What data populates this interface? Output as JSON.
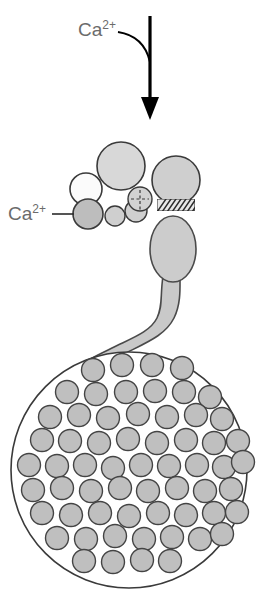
{
  "figure": {
    "width": 259,
    "height": 591,
    "background_color": "#ffffff"
  },
  "labels": {
    "influx": {
      "base": "Ca",
      "superscript": "2+",
      "full": "Ca2+",
      "color": "#6b6b6b",
      "x": 78,
      "y": 36
    },
    "binding": {
      "base": "Ca",
      "superscript": "2+",
      "full": "Ca2+",
      "color": "#6b6b6b",
      "x": 10,
      "y": 220
    }
  },
  "arrow": {
    "name": "calcium-influx-arrow",
    "color": "#000000",
    "shaft_x": 150,
    "shaft_top_y": 16,
    "shaft_bottom_y": 100,
    "shaft_width": 3,
    "head_tip_y": 120,
    "head_half_width": 9,
    "curve": {
      "start_x": 118,
      "start_y": 32,
      "end_x": 150,
      "end_y": 62,
      "color": "#000000",
      "stroke_width": 2
    }
  },
  "colors": {
    "outline_dark": "#3a3a3a",
    "outline_mid": "#555555",
    "fill_light": "#dcdcdc",
    "fill_white": "#fcfcfc",
    "fill_mid": "#c4c4c4",
    "fill_vesicle": "#bfbfbf",
    "fill_neck": "#c9c9c9",
    "hatch_color": "#2b2b2b",
    "label_gray": "#6b6b6b",
    "cell_interior": "#ffffff"
  },
  "cluster": {
    "name": "membrane-protein-cluster",
    "description": "Cluster of circles representing vesicle and membrane proteins near the release site",
    "circles": [
      {
        "name": "large-upper-granule",
        "cx": 121,
        "cy": 166,
        "r": 24,
        "fill": "#d8d8d8",
        "stroke": "#3a3a3a",
        "stroke_width": 1.6
      },
      {
        "name": "right-upper-granule",
        "cx": 176,
        "cy": 180,
        "r": 24,
        "fill": "#cfcfcf",
        "stroke": "#3a3a3a",
        "stroke_width": 1.6
      },
      {
        "name": "white-left-circle",
        "cx": 86,
        "cy": 189,
        "r": 16,
        "fill": "#fbfbfb",
        "stroke": "#3a3a3a",
        "stroke_width": 1.6
      },
      {
        "name": "ca-binding-circle",
        "cx": 88,
        "cy": 214,
        "r": 15,
        "fill": "#bdbdbd",
        "stroke": "#3a3a3a",
        "stroke_width": 1.6
      },
      {
        "name": "small-chain-circle-1",
        "cx": 115,
        "cy": 216,
        "r": 10,
        "fill": "#cfcfcf",
        "stroke": "#3a3a3a",
        "stroke_width": 1.4
      },
      {
        "name": "small-chain-circle-2",
        "cx": 136,
        "cy": 211,
        "r": 11,
        "fill": "#cfcfcf",
        "stroke": "#3a3a3a",
        "stroke_width": 1.4
      },
      {
        "name": "dashed-fusion-circle",
        "cx": 140,
        "cy": 199,
        "r": 12,
        "fill": "#d2d2d2",
        "stroke": "#3a3a3a",
        "stroke_width": 1.4
      }
    ],
    "dashed_marks": [
      {
        "name": "dashed-vertical-mark",
        "x1": 140,
        "y1": 190,
        "x2": 140,
        "y2": 211
      },
      {
        "name": "dashed-horizontal-mark",
        "x1": 131,
        "y1": 199,
        "x2": 149,
        "y2": 199
      }
    ],
    "hatched_zone": {
      "name": "membrane-fusion-hatched-zone",
      "x": 157,
      "y": 199,
      "width": 38,
      "height": 12,
      "stripe_count": 9,
      "color": "#2b2b2b"
    },
    "leader_line": {
      "name": "calcium-binding-leader-line",
      "x1": 52,
      "y1": 214,
      "x2": 74,
      "y2": 214,
      "color": "#2b2b2b",
      "stroke_width": 1.6
    }
  },
  "flask": {
    "name": "fusing-granule-flask",
    "description": "Teardrop shaped fusing granule narrowing into a winding neck",
    "fill": "#cccccc",
    "stroke": "#4a4a4a",
    "stroke_width": 1.6,
    "body_cx": 173,
    "body_cy": 249,
    "body_rx": 23,
    "body_ry": 33
  },
  "neck": {
    "name": "granule-neck-channel",
    "fill": "#c9c9c9",
    "stroke": "#4a4a4a",
    "stroke_width": 1.6,
    "description": "Winding Z-shaped neck connecting the fusing granule to the cell surface"
  },
  "cell": {
    "name": "secretory-cell-body",
    "cx": 129,
    "cy": 470,
    "r": 118,
    "fill": "#ffffff",
    "stroke": "#3a3a3a",
    "stroke_width": 1.6,
    "vesicle": {
      "name": "intracellular-vesicle",
      "radius": 11.5,
      "fill": "#bfbfbf",
      "stroke": "#444444",
      "stroke_width": 1.4,
      "count": 62
    },
    "vesicle_positions": [
      [
        93,
        370
      ],
      [
        122,
        365
      ],
      [
        152,
        365
      ],
      [
        182,
        368
      ],
      [
        67,
        392
      ],
      [
        96,
        394
      ],
      [
        126,
        392
      ],
      [
        155,
        391
      ],
      [
        184,
        392
      ],
      [
        210,
        397
      ],
      [
        50,
        417
      ],
      [
        79,
        415
      ],
      [
        108,
        418
      ],
      [
        138,
        414
      ],
      [
        167,
        417
      ],
      [
        196,
        415
      ],
      [
        222,
        419
      ],
      [
        42,
        440
      ],
      [
        70,
        441
      ],
      [
        99,
        443
      ],
      [
        128,
        439
      ],
      [
        157,
        443
      ],
      [
        186,
        440
      ],
      [
        214,
        443
      ],
      [
        238,
        441
      ],
      [
        29,
        465
      ],
      [
        57,
        466
      ],
      [
        85,
        465
      ],
      [
        113,
        468
      ],
      [
        141,
        465
      ],
      [
        169,
        466
      ],
      [
        197,
        465
      ],
      [
        224,
        467
      ],
      [
        243,
        462
      ],
      [
        33,
        490
      ],
      [
        62,
        488
      ],
      [
        91,
        491
      ],
      [
        120,
        488
      ],
      [
        148,
        491
      ],
      [
        177,
        488
      ],
      [
        205,
        491
      ],
      [
        231,
        489
      ],
      [
        42,
        513
      ],
      [
        71,
        515
      ],
      [
        100,
        513
      ],
      [
        129,
        516
      ],
      [
        158,
        513
      ],
      [
        186,
        515
      ],
      [
        214,
        513
      ],
      [
        237,
        512
      ],
      [
        57,
        538
      ],
      [
        86,
        539
      ],
      [
        115,
        536
      ],
      [
        144,
        539
      ],
      [
        172,
        537
      ],
      [
        200,
        539
      ],
      [
        222,
        534
      ],
      [
        84,
        561
      ],
      [
        113,
        562
      ],
      [
        142,
        560
      ],
      [
        170,
        561
      ]
    ]
  }
}
